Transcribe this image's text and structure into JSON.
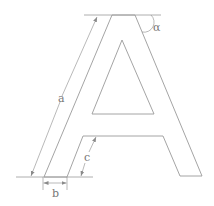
{
  "diagram": {
    "colors": {
      "stroke": "#9a9a9a",
      "dim_stroke": "#8a8a8a",
      "label": "#777777",
      "background": "#ffffff"
    },
    "labels": {
      "a": "a",
      "b": "b",
      "c": "c",
      "alpha": "α"
    },
    "dimensions": [
      {
        "name": "a",
        "description": "slanted length of left stroke"
      },
      {
        "name": "b",
        "description": "horizontal width of stroke foot"
      },
      {
        "name": "c",
        "description": "slanted height from baseline to crossbar"
      },
      {
        "name": "alpha",
        "description": "angle between right stroke and top line"
      }
    ]
  }
}
